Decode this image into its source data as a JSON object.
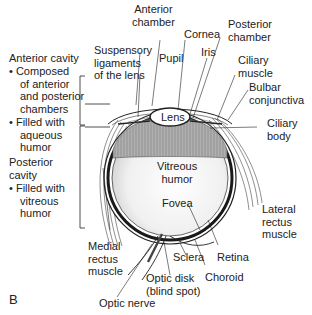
{
  "figure": {
    "panel_letter": "B"
  },
  "left_notes": {
    "anterior_cavity": {
      "title": "Anterior cavity",
      "bullets": [
        "Composed of anterior and posterior chambers",
        "Filled with aqueous humor"
      ],
      "bullet1_lines": [
        "Composed",
        "of anterior",
        "and posterior",
        "chambers"
      ],
      "bullet2_lines": [
        "Filled with",
        "aqueous",
        "humor"
      ]
    },
    "posterior_cavity": {
      "title_lines": [
        "Posterior",
        "cavity"
      ],
      "bullet1_lines": [
        "Filled with",
        "vitreous",
        "humor"
      ]
    },
    "bullet_glyph": "•"
  },
  "labels": {
    "anterior_chamber": [
      "Anterior",
      "chamber"
    ],
    "cornea": "Cornea",
    "posterior_chamber": [
      "Posterior",
      "chamber"
    ],
    "suspensory_ligaments": [
      "Suspensory",
      "ligaments",
      "of the lens"
    ],
    "pupil": "Pupil",
    "iris": "Iris",
    "ciliary_muscle": [
      "Ciliary",
      "muscle"
    ],
    "bulbar_conjunctiva": [
      "Bulbar",
      "conjunctiva"
    ],
    "lens": "Lens",
    "ciliary_body": [
      "Ciliary",
      "body"
    ],
    "vitreous_humor": [
      "Vitreous",
      "humor"
    ],
    "fovea": "Fovea",
    "lateral_rectus_muscle": [
      "Lateral",
      "rectus",
      "muscle"
    ],
    "medial_rectus_muscle": [
      "Medial",
      "rectus",
      "muscle"
    ],
    "sclera": "Sclera",
    "retina": "Retina",
    "choroid": "Choroid",
    "optic_disk": [
      "Optic disk",
      "(blind spot)"
    ],
    "optic_nerve": "Optic nerve"
  },
  "colors": {
    "outline": "#222222",
    "ciliary_gray": "#a8a8a8",
    "choroid_dark": "#1a1a1a",
    "vitreous_light": "#f2f2f2"
  }
}
